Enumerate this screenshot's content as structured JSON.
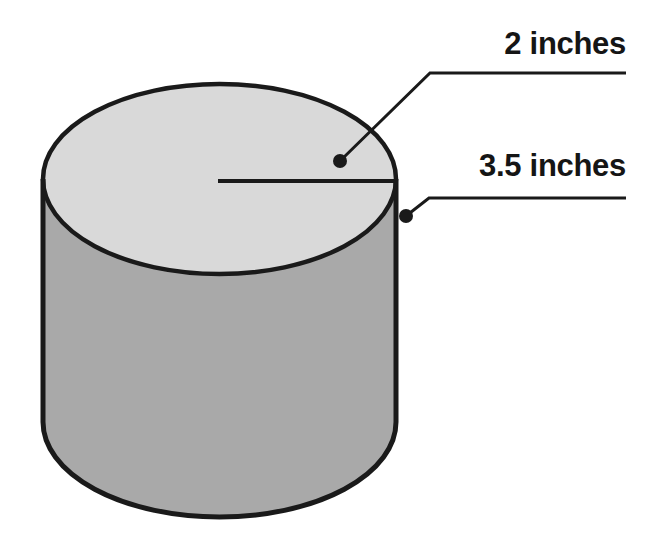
{
  "figure": {
    "shape": "cylinder",
    "background_color": "#ffffff"
  },
  "colors": {
    "outline": "#1a1a1a",
    "top_face_fill": "#d9d9d9",
    "body_fill": "#a9a9a9",
    "leader_line": "#1a1a1a",
    "label_text": "#151515"
  },
  "labels": {
    "diameter": {
      "text": "2 inches",
      "value": 2,
      "unit": "inches",
      "refers_to": "radius-of-top-circle"
    },
    "height": {
      "text": "3.5 inches",
      "value": 3.5,
      "unit": "inches",
      "refers_to": "height-of-cylinder"
    }
  },
  "geometry": {
    "top_ellipse": {
      "cx": 219.5,
      "cy": 179,
      "rx": 176.5,
      "ry": 95
    },
    "bottom_ellipse": {
      "cx": 219.5,
      "cy": 422,
      "rx": 176.5,
      "ry": 95
    },
    "left_edge_x": 43,
    "right_edge_x": 396,
    "radius_line": {
      "x1": 218,
      "y1": 181,
      "x2": 393,
      "y2": 181
    },
    "leader_diameter": {
      "dot_x": 340,
      "dot_y": 161,
      "elbow_x": 430,
      "elbow_y": 73,
      "end_x": 626,
      "end_y": 73
    },
    "leader_height": {
      "dot_x": 406,
      "dot_y": 216,
      "elbow_x": 429,
      "elbow_y": 198,
      "end_x": 626,
      "end_y": 198
    }
  }
}
